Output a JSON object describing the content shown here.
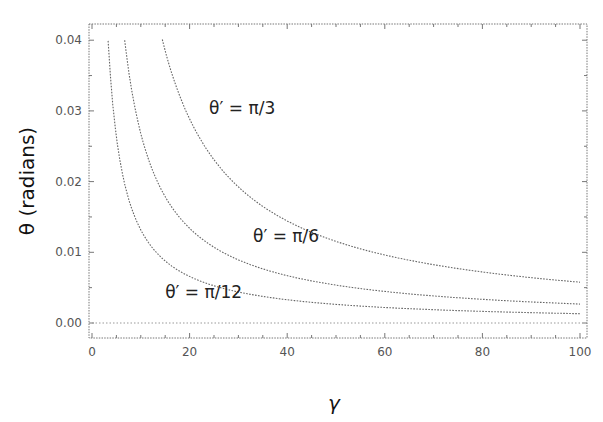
{
  "chart_data": {
    "type": "line",
    "title": "",
    "xlabel": "γ",
    "ylabel": "θ (radians)",
    "xlim": [
      0,
      100
    ],
    "ylim": [
      -0.0022,
      0.042
    ],
    "grid": false,
    "legend": "none (inline curve labels)",
    "x_ticks": [
      0,
      20,
      40,
      60,
      80,
      100
    ],
    "x_tick_labels": [
      "0",
      "20",
      "40",
      "60",
      "80",
      "100"
    ],
    "y_ticks": [
      0.0,
      0.01,
      0.02,
      0.03,
      0.04
    ],
    "y_tick_labels": [
      "0.00",
      "0.01",
      "0.02",
      "0.03",
      "0.04"
    ],
    "reference_line": {
      "y": 0.0,
      "style": "dotted"
    },
    "series": [
      {
        "name": "θ′ = π/12",
        "label": "θ′ = π/12",
        "theta_prime": 0.2618,
        "x": [
          3.3,
          5,
          10,
          20,
          30,
          40,
          50,
          60,
          70,
          80,
          90,
          100
        ],
        "values": [
          0.04,
          0.0263,
          0.0132,
          0.0066,
          0.0044,
          0.0033,
          0.0026,
          0.0022,
          0.0019,
          0.0016,
          0.0015,
          0.0013
        ],
        "label_pos": {
          "x": 15,
          "y": 0.0035
        }
      },
      {
        "name": "θ′ = π/6",
        "label": "θ′ = π/6",
        "theta_prime": 0.5236,
        "x": [
          6.7,
          10,
          15,
          20,
          30,
          40,
          50,
          60,
          70,
          80,
          90,
          100
        ],
        "values": [
          0.04,
          0.0268,
          0.0179,
          0.0134,
          0.0089,
          0.0067,
          0.0054,
          0.0045,
          0.0038,
          0.0034,
          0.003,
          0.0027
        ],
        "label_pos": {
          "x": 33,
          "y": 0.0115
        }
      },
      {
        "name": "θ′ = π/3",
        "label": "θ′ = π/3",
        "theta_prime": 1.0472,
        "x": [
          14.4,
          20,
          30,
          40,
          50,
          60,
          70,
          80,
          90,
          100
        ],
        "values": [
          0.04,
          0.0289,
          0.0192,
          0.0144,
          0.0115,
          0.0096,
          0.0082,
          0.0072,
          0.0064,
          0.0058
        ],
        "label_pos": {
          "x": 24,
          "y": 0.0295
        }
      }
    ]
  }
}
